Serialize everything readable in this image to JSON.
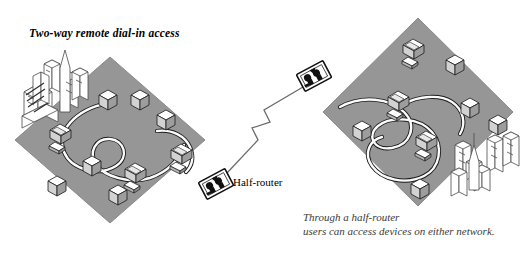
{
  "figure": {
    "title": "Two-way remote dial-in access",
    "caption_line1": "Through a half-router",
    "caption_line2": "users can access devices on either network."
  },
  "labels": {
    "half_router": "Half-router"
  },
  "colors": {
    "diamond_fill": "#969696",
    "diamond_edge": "#7a7a7a",
    "device_top": "#ffffff",
    "device_side_light": "#d8d8d8",
    "device_side_dark": "#a8a8a8",
    "outline": "#1a1a1a",
    "cable_core": "#ffffff",
    "cable_edge": "#1a1a1a",
    "background": "#ffffff",
    "skyline_line": "#4a4a4a",
    "caption_text": "#3a3a3a",
    "title_text": "#000000"
  },
  "networks": [
    {
      "name": "left-network",
      "center": [
        110,
        140
      ],
      "half_width": 95,
      "half_height": 83,
      "device_count": 9,
      "skyline_position": "upper-left"
    },
    {
      "name": "right-network",
      "center": [
        418,
        112
      ],
      "half_width": 95,
      "half_height": 94,
      "device_count": 8,
      "skyline_position": "lower-right"
    }
  ],
  "routers": [
    {
      "name": "lower-half-router",
      "position": [
        216,
        184
      ],
      "rotation": -28
    },
    {
      "name": "upper-half-router",
      "position": [
        314,
        76
      ],
      "rotation": -28
    }
  ],
  "link": {
    "name": "dial-in-link",
    "from": [
      225,
      172
    ],
    "to": [
      305,
      88
    ],
    "style": "lightning"
  }
}
